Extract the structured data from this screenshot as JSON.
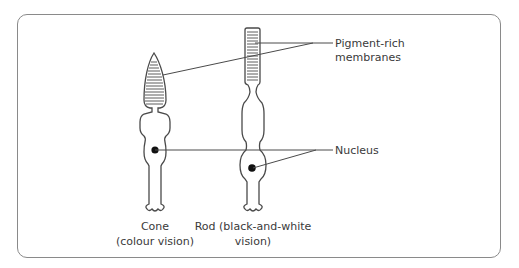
{
  "diagram": {
    "labels": {
      "pigment_line1": "Pigment-rich",
      "pigment_line2": "membranes",
      "nucleus": "Nucleus"
    },
    "cells": [
      {
        "name": "Cone",
        "caption_line1": "Cone",
        "caption_line2": "(colour vision)"
      },
      {
        "name": "Rod",
        "caption_line1": "Rod (black-and-white",
        "caption_line2": "vision)"
      }
    ],
    "colors": {
      "stroke": "#4a4a4a",
      "frame": "#8a8a8a",
      "text": "#3a3a3a",
      "nucleus_dot": "#111111"
    }
  }
}
